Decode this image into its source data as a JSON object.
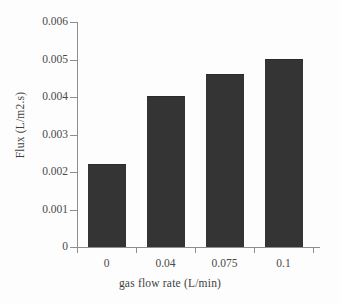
{
  "chart_data": {
    "type": "bar",
    "title": "",
    "xlabel": "gas flow rate (L/min)",
    "ylabel": "Flux (L/m2.s)",
    "categories": [
      "0",
      "0.04",
      "0.075",
      "0.1"
    ],
    "values": [
      0.0022,
      0.004,
      0.0046,
      0.005
    ],
    "series": [
      {
        "name": "Flux",
        "values": [
          0.0022,
          0.004,
          0.0046,
          0.005
        ]
      }
    ],
    "ylim": [
      0,
      0.006
    ],
    "ytick_labels": [
      "0",
      "0.001",
      "0.002",
      "0.003",
      "0.004",
      "0.005",
      "0.006"
    ],
    "ytick_values": [
      0,
      0.001,
      0.002,
      0.003,
      0.004,
      0.005,
      0.006
    ],
    "grid": false,
    "legend": false,
    "legend_position": "none",
    "bar_color": "#343434",
    "axis_color": "#8e8e8e",
    "background_color": "#ffffff"
  }
}
